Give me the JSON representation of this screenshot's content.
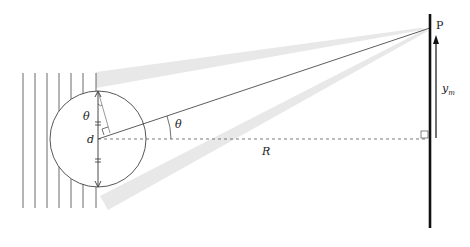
{
  "diagram": {
    "labels": {
      "point": "P",
      "theta_top": "θ",
      "theta_angle": "θ",
      "slit_sep": "d",
      "distance": "R",
      "y": "y",
      "y_sub": "m"
    },
    "colors": {
      "line": "#333333",
      "beam": "#e6e6e6",
      "screen": "#111111"
    }
  }
}
